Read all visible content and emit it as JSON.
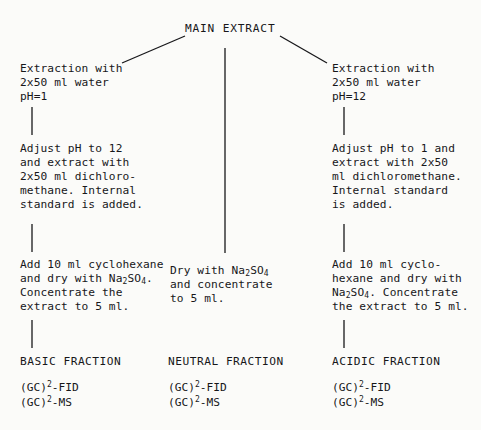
{
  "diagram": {
    "title": "MAIN EXTRACT",
    "type": "flowchart",
    "branches": [
      {
        "id": "basic",
        "steps": [
          "Extraction with\n2x50 ml water\npH=1",
          "Adjust pH to 12\nand extract with\n2x50 ml dichloro-\nmethane. Internal\nstandard is added.",
          "Add 10 ml cyclohexane\nand dry with Na2SO4.\nConcentrate the\nextract to 5 ml."
        ],
        "fraction_label": "BASIC FRACTION",
        "analyses": [
          "(GC)2-FID",
          "(GC)2-MS"
        ]
      },
      {
        "id": "neutral",
        "steps": [
          "Dry with Na2SO4\nand concentrate\nto 5 ml."
        ],
        "fraction_label": "NEUTRAL FRACTION",
        "analyses": [
          "(GC)2-FID",
          "(GC)2-MS"
        ]
      },
      {
        "id": "acidic",
        "steps": [
          "Extraction with\n2x50 ml water\npH=12",
          "Adjust pH to 1 and\nextract with 2x50\nml dichloromethane.\nInternal standard\nis added.",
          "Add 10 ml cyclo-\nhexane and dry with\nNa2SO4. Concentrate\nthe extract to 5 ml."
        ],
        "fraction_label": "ACIDIC FRACTION",
        "analyses": [
          "(GC)2-FID",
          "(GC)2-MS"
        ]
      }
    ]
  },
  "left": {
    "step1_line1": "Extraction with",
    "step1_line2": "2x50 ml water",
    "step1_line3": "pH=1",
    "step2_line1": "Adjust pH to 12",
    "step2_line2": "and extract with",
    "step2_line3": "2x50 ml dichloro-",
    "step2_line4": "methane. Internal",
    "step2_line5": "standard is added.",
    "step3_line1": "Add 10 ml cyclohexane",
    "step3_line2a": "and dry with Na",
    "step3_line2b": "2",
    "step3_line2c": "SO",
    "step3_line2d": "4",
    "step3_line2e": ".",
    "step3_line3": "Concentrate the",
    "step3_line4": "extract to 5 ml.",
    "fraction": "BASIC FRACTION",
    "assay1a": "(GC)",
    "assay1b": "2",
    "assay1c": "-FID",
    "assay2a": "(GC)",
    "assay2b": "2",
    "assay2c": "-MS"
  },
  "middle": {
    "step_line1a": "Dry with Na",
    "step_line1b": "2",
    "step_line1c": "SO",
    "step_line1d": "4",
    "step_line2": "and concentrate",
    "step_line3": "to 5 ml.",
    "fraction": "NEUTRAL FRACTION",
    "assay1a": "(GC)",
    "assay1b": "2",
    "assay1c": "-FID",
    "assay2a": "(GC)",
    "assay2b": "2",
    "assay2c": "-MS"
  },
  "right": {
    "step1_line1": "Extraction with",
    "step1_line2": "2x50 ml water",
    "step1_line3": "pH=12",
    "step2_line1": "Adjust pH to 1 and",
    "step2_line2": "extract with 2x50",
    "step2_line3": "ml dichloromethane.",
    "step2_line4": "Internal standard",
    "step2_line5": "is added.",
    "step3_line1": "Add 10 ml cyclo-",
    "step3_line2": "hexane and dry with",
    "step3_line3a": "Na",
    "step3_line3b": "2",
    "step3_line3c": "SO",
    "step3_line3d": "4",
    "step3_line3e": ". Concentrate",
    "step3_line4": "the extract to 5 ml.",
    "fraction": "ACIDIC FRACTION",
    "assay1a": "(GC)",
    "assay1b": "2",
    "assay1c": "-FID",
    "assay2a": "(GC)",
    "assay2b": "2",
    "assay2c": "-MS"
  },
  "colors": {
    "ink": "#17171a",
    "background": "#fbfbf9"
  }
}
